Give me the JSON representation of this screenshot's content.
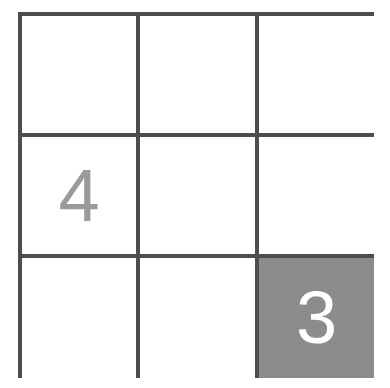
{
  "puzzle": {
    "rows": 3,
    "cols": 3,
    "colors": {
      "grid_line": "#4d4d4d",
      "given_text": "#9a9a9a",
      "filled_bg": "#8c8c8c",
      "filled_text": "#ffffff",
      "empty_bg": "#ffffff"
    },
    "cells": [
      {
        "row": 0,
        "col": 0,
        "value": "",
        "state": "empty"
      },
      {
        "row": 0,
        "col": 1,
        "value": "",
        "state": "empty"
      },
      {
        "row": 0,
        "col": 2,
        "value": "",
        "state": "empty"
      },
      {
        "row": 1,
        "col": 0,
        "value": "4",
        "state": "given"
      },
      {
        "row": 1,
        "col": 1,
        "value": "",
        "state": "empty"
      },
      {
        "row": 1,
        "col": 2,
        "value": "",
        "state": "empty"
      },
      {
        "row": 2,
        "col": 0,
        "value": "",
        "state": "empty"
      },
      {
        "row": 2,
        "col": 1,
        "value": "",
        "state": "empty"
      },
      {
        "row": 2,
        "col": 2,
        "value": "3",
        "state": "filled"
      }
    ]
  }
}
